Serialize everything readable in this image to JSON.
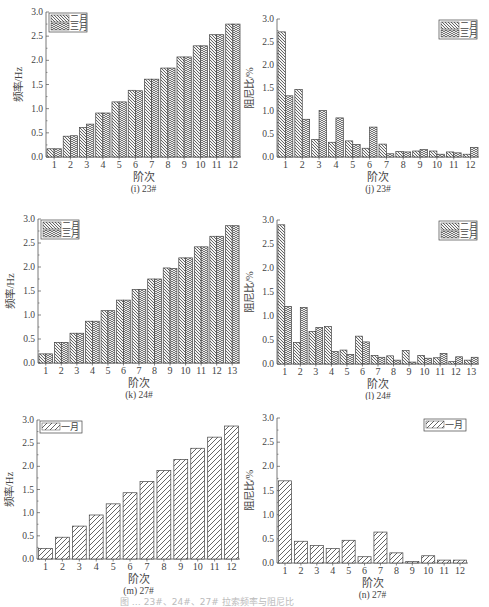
{
  "figure_caption": "图 … 23#、24#、27# 拉索频率与阻尼比",
  "patterns": {
    "feb": "hatch-down",
    "mar": "hatch-herringbone",
    "jan": "hatch-diagonal"
  },
  "chart_data": [
    {
      "id": "i",
      "type": "bar",
      "subtitle": "(i) 23#",
      "xlabel": "阶次",
      "ylabel": "频率/Hz",
      "ylim": [
        0,
        3.0
      ],
      "yticks": [
        "0.0",
        "0.5",
        "1.0",
        "1.5",
        "2.0",
        "2.5",
        "3.0"
      ],
      "categories": [
        "1",
        "2",
        "3",
        "4",
        "5",
        "6",
        "7",
        "8",
        "9",
        "10",
        "11",
        "12"
      ],
      "legend_position": "top-left",
      "series": [
        {
          "name": "二月",
          "values": [
            0.17,
            0.43,
            0.61,
            0.91,
            1.14,
            1.38,
            1.61,
            1.84,
            2.07,
            2.3,
            2.53,
            2.75
          ]
        },
        {
          "name": "三月",
          "values": [
            0.17,
            0.44,
            0.68,
            0.91,
            1.14,
            1.37,
            1.61,
            1.84,
            2.07,
            2.3,
            2.53,
            2.75
          ]
        }
      ]
    },
    {
      "id": "j",
      "type": "bar",
      "subtitle": "(j) 23#",
      "xlabel": "阶次",
      "ylabel": "阻尼比/%",
      "ylim": [
        0,
        3.0
      ],
      "yticks": [
        "0.0",
        "0.5",
        "1.0",
        "1.5",
        "2.0",
        "2.5",
        "3.0"
      ],
      "categories": [
        "1",
        "2",
        "3",
        "4",
        "5",
        "6",
        "7",
        "8",
        "9",
        "10",
        "11",
        "12"
      ],
      "legend_position": "top-right",
      "series": [
        {
          "name": "二月",
          "values": [
            2.72,
            1.47,
            0.38,
            0.32,
            0.35,
            0.19,
            0.28,
            0.12,
            0.13,
            0.13,
            0.11,
            0.06
          ]
        },
        {
          "name": "三月",
          "values": [
            1.33,
            0.82,
            1.01,
            0.85,
            0.27,
            0.65,
            0.07,
            0.11,
            0.16,
            0.06,
            0.09,
            0.21
          ]
        }
      ]
    },
    {
      "id": "k",
      "type": "bar",
      "subtitle": "(k) 24#",
      "xlabel": "阶次",
      "ylabel": "频率/Hz",
      "ylim": [
        0,
        3.0
      ],
      "yticks": [
        "0.0",
        "0.5",
        "1.0",
        "1.5",
        "2.0",
        "2.5",
        "3.0"
      ],
      "categories": [
        "1",
        "2",
        "3",
        "4",
        "5",
        "6",
        "7",
        "8",
        "9",
        "10",
        "11",
        "12",
        "13"
      ],
      "legend_position": "top-left",
      "series": [
        {
          "name": "二月",
          "values": [
            0.19,
            0.43,
            0.62,
            0.87,
            1.09,
            1.31,
            1.53,
            1.75,
            1.98,
            2.19,
            2.42,
            2.64,
            2.86
          ]
        },
        {
          "name": "三月",
          "values": [
            0.19,
            0.43,
            0.62,
            0.87,
            1.09,
            1.31,
            1.53,
            1.75,
            1.97,
            2.19,
            2.42,
            2.64,
            2.86
          ]
        }
      ]
    },
    {
      "id": "l",
      "type": "bar",
      "subtitle": "(l) 24#",
      "xlabel": "阶次",
      "ylabel": "阻尼比/%",
      "ylim": [
        0,
        3.0
      ],
      "yticks": [
        "0.0",
        "0.5",
        "1.0",
        "1.5",
        "2.0",
        "2.5",
        "3.0"
      ],
      "categories": [
        "1",
        "2",
        "3",
        "4",
        "5",
        "6",
        "7",
        "8",
        "9",
        "10",
        "11",
        "12",
        "13"
      ],
      "legend_position": "top-right",
      "series": [
        {
          "name": "二月",
          "values": [
            2.9,
            0.45,
            0.68,
            0.78,
            0.29,
            0.58,
            0.18,
            0.17,
            0.28,
            0.18,
            0.13,
            0.05,
            0.08
          ]
        },
        {
          "name": "三月",
          "values": [
            1.2,
            1.18,
            0.76,
            0.26,
            0.2,
            0.46,
            0.14,
            0.08,
            0.04,
            0.12,
            0.22,
            0.15,
            0.14
          ]
        }
      ]
    },
    {
      "id": "m",
      "type": "bar",
      "subtitle": "(m) 27#",
      "xlabel": "阶次",
      "ylabel": "频率/Hz",
      "ylim": [
        0,
        3.0
      ],
      "yticks": [
        "0.0",
        "0.5",
        "1.0",
        "1.5",
        "2.0",
        "2.5",
        "3.0"
      ],
      "categories": [
        "1",
        "2",
        "3",
        "4",
        "5",
        "6",
        "7",
        "8",
        "9",
        "10",
        "11",
        "12"
      ],
      "legend_position": "top-left",
      "series": [
        {
          "name": "一月",
          "values": [
            0.23,
            0.47,
            0.71,
            0.95,
            1.19,
            1.43,
            1.67,
            1.91,
            2.15,
            2.39,
            2.63,
            2.87
          ]
        }
      ]
    },
    {
      "id": "n",
      "type": "bar",
      "subtitle": "(n) 27#",
      "xlabel": "阶次",
      "ylabel": "阻尼比/%",
      "ylim": [
        0,
        3.0
      ],
      "yticks": [
        "0.0",
        "0.5",
        "1.0",
        "1.5",
        "2.0",
        "2.5",
        "3.0"
      ],
      "categories": [
        "1",
        "2",
        "3",
        "4",
        "5",
        "6",
        "7",
        "8",
        "9",
        "10",
        "11",
        "12"
      ],
      "legend_position": "top-right",
      "series": [
        {
          "name": "一月",
          "values": [
            1.7,
            0.45,
            0.36,
            0.3,
            0.47,
            0.13,
            0.64,
            0.21,
            0.03,
            0.15,
            0.06,
            0.06
          ]
        }
      ]
    }
  ],
  "layout": {
    "panels": [
      {
        "id": "i",
        "x": 0,
        "y": 0,
        "w": 245,
        "h": 200,
        "axisLeft": 46,
        "axisRight": 241,
        "axisTop": 12,
        "axisBottom": 157
      },
      {
        "id": "j",
        "x": 240,
        "y": 0,
        "w": 249,
        "h": 200,
        "axisLeft": 37,
        "axisRight": 239,
        "axisTop": 19,
        "axisBottom": 157
      },
      {
        "id": "k",
        "x": 0,
        "y": 200,
        "w": 245,
        "h": 200,
        "axisLeft": 38,
        "axisRight": 240,
        "axisTop": 19,
        "axisBottom": 163
      },
      {
        "id": "l",
        "x": 240,
        "y": 200,
        "w": 249,
        "h": 200,
        "axisLeft": 37,
        "axisRight": 239,
        "axisTop": 20,
        "axisBottom": 164
      },
      {
        "id": "m",
        "x": 0,
        "y": 400,
        "w": 245,
        "h": 207,
        "axisLeft": 37,
        "axisRight": 240,
        "axisTop": 20,
        "axisBottom": 159
      },
      {
        "id": "n",
        "x": 240,
        "y": 400,
        "w": 249,
        "h": 207,
        "axisLeft": 37,
        "axisRight": 228,
        "axisTop": 18,
        "axisBottom": 163
      }
    ]
  }
}
